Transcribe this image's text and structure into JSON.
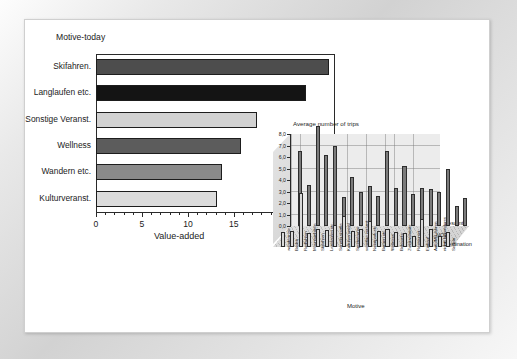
{
  "figure": {
    "background_color": "#ffffff",
    "frame_color": "#d7d7d7"
  },
  "chart_data": [
    {
      "type": "bar",
      "orientation": "horizontal",
      "title": "",
      "ylabel": "Motive-today",
      "xlabel": "Value-added",
      "xlim": [
        0,
        26
      ],
      "xticks": [
        0,
        5,
        10,
        15,
        20,
        25
      ],
      "xtick_labels": [
        "0",
        "5",
        "10",
        "15",
        "20",
        "25"
      ],
      "grid": false,
      "categories": [
        "Skifahren.",
        "Langlaufen etc.",
        "Sonstige Veranst.",
        "Wellness",
        "Wandern etc.",
        "Kulturveranst."
      ],
      "values": [
        25.3,
        22.8,
        17.5,
        15.8,
        13.7,
        13.2
      ],
      "bar_colors": [
        "#4d4d4d",
        "#141414",
        "#d2d2d2",
        "#5c5c5c",
        "#8a8a8a",
        "#dcdcdc"
      ]
    },
    {
      "type": "bar",
      "style": "3d-grouped",
      "title": "Average number of trips",
      "xlabel": "Motive",
      "ylabel": "",
      "zlabel": "Destination",
      "ylim": [
        0.0,
        8.0
      ],
      "yticks": [
        0.0,
        1.0,
        2.0,
        3.0,
        4.0,
        5.0,
        6.0,
        7.0,
        8.0
      ],
      "ytick_labels": [
        "0,0",
        "1,0",
        "2,0",
        "3,0",
        "4,0",
        "5,0",
        "6,0",
        "7,0",
        "8,0"
      ],
      "grid": true,
      "legend_position": "right",
      "categories": [
        "wandern etc.",
        "Baden",
        "Radfahren",
        "Mountainbiken",
        "Skifahren",
        "Langlaufen etc.",
        "Sonstig sportle",
        "Kulturveranstal",
        "Sportveranst",
        "sonstige veranst",
        "Naturpark etc.",
        "Burgen etc.",
        "Wellness",
        "Bekannte",
        "Zweitwohnsitz",
        "Restaurant",
        "Einkauf",
        "Auto/MR fahren",
        "nichts besonderes",
        "Segeln"
      ],
      "series": [
        {
          "name": "gesamt",
          "values": [
            6.5,
            3.6,
            8.7,
            6.2,
            7.0,
            2.5,
            4.3,
            3.0,
            3.5,
            2.6,
            6.5,
            3.3,
            5.2,
            2.8,
            3.3,
            3.2,
            3.0,
            5.0,
            1.7,
            2.4
          ]
        },
        {
          "name": "NOE",
          "values": [
            1.3,
            1.4,
            4.7,
            1.2,
            1.6,
            1.5,
            1.9,
            2.7,
            1.4,
            1.6,
            2.3,
            1.4,
            1.6,
            1.3,
            1.2,
            1.0,
            2.4,
            1.6,
            1.0,
            1.3
          ]
        }
      ]
    }
  ],
  "main_chart": {
    "axis_title_y": "Motive-today",
    "axis_title_x": "Value-added",
    "tick_labels": [
      "0",
      "5",
      "10",
      "15",
      "20",
      "25"
    ],
    "bars": [
      {
        "label": "Skifahren.",
        "value": 25.3,
        "color": "#4d4d4d"
      },
      {
        "label": "Langlaufen etc.",
        "value": 22.8,
        "color": "#141414"
      },
      {
        "label": "Sonstige Veranst.",
        "value": 17.5,
        "color": "#d2d2d2"
      },
      {
        "label": "Wellness",
        "value": 15.8,
        "color": "#5c5c5c"
      },
      {
        "label": "Wandern etc.",
        "value": 13.7,
        "color": "#8a8a8a"
      },
      {
        "label": "Kulturveranst.",
        "value": 13.2,
        "color": "#dcdcdc"
      }
    ]
  },
  "inset_chart": {
    "title": "Average number of trips",
    "axis_title_x": "Motive",
    "axis_title_z": "Destination",
    "y_tick_labels": [
      "8,0",
      "7,0",
      "6,0",
      "5,0",
      "4,0",
      "3,0",
      "2,0",
      "1,0",
      "0,0"
    ],
    "legend": [
      "gesamt",
      "NOE"
    ],
    "category_labels": [
      "wandern etc.",
      "Baden",
      "Radfahren",
      "Mountainbiken",
      "Skifahren",
      "Langlaufen etc.",
      "Sonstig sportle",
      "Kulturveranstal",
      "Sportveranst",
      "sonstige veranst",
      "Naturpark etc.",
      "Burgen etc.",
      "Wellness",
      "Bekannte",
      "Zweitwohnsitz",
      "Restaurant",
      "Einkauf",
      "Auto/MR fahren",
      "nichts besonderes",
      "Segeln"
    ]
  }
}
